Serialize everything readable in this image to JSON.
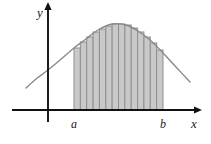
{
  "figure": {
    "title": "",
    "background": "#ffffff",
    "width": 211,
    "height": 144
  },
  "axes": {
    "x_label": "x",
    "y_label": "y",
    "x_axis_color": "#111111",
    "y_axis_color": "#111111",
    "x_axis_y": 110,
    "y_axis_x": 48,
    "x_axis_from": 12,
    "x_axis_to": 198,
    "y_axis_from": 6,
    "y_axis_to": 122,
    "arrowheads": true
  },
  "tick_labels": {
    "a": "a",
    "b": "b",
    "a_x": 74,
    "b_x": 163
  },
  "chart_data": {
    "type": "area",
    "title": "",
    "xlabel": "x",
    "ylabel": "y",
    "grid": false,
    "legend": null,
    "annotations": [
      "a",
      "b",
      "x",
      "y"
    ],
    "curve_color": "#8a8a8a",
    "rect_fill": "#c9c9c9",
    "rect_stroke": "#8f8f8f",
    "interval": {
      "a": 74,
      "b": 163
    },
    "n_rectangles": 14,
    "rule": "left-endpoint",
    "baseline_y": 110,
    "curve_points": [
      [
        26,
        88
      ],
      [
        36,
        79
      ],
      [
        48,
        70
      ],
      [
        60,
        60
      ],
      [
        74,
        48
      ],
      [
        86,
        39
      ],
      [
        98,
        30
      ],
      [
        112,
        24
      ],
      [
        126,
        25
      ],
      [
        138,
        31
      ],
      [
        150,
        40
      ],
      [
        163,
        53
      ],
      [
        176,
        67
      ],
      [
        190,
        82
      ]
    ],
    "rect_tops": [
      48,
      42,
      37,
      32,
      29,
      26,
      24,
      24,
      25,
      28,
      32,
      37,
      43,
      50
    ],
    "x_range": [
      26,
      190
    ],
    "y_range": [
      24,
      110
    ]
  }
}
